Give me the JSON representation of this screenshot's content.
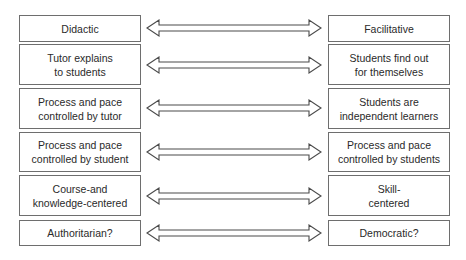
{
  "diagram": {
    "rows": [
      {
        "left": [
          "Didactic"
        ],
        "right": [
          "Facilitative"
        ]
      },
      {
        "left": [
          "Tutor explains",
          "to students"
        ],
        "right": [
          "Students find out",
          "for themselves"
        ]
      },
      {
        "left": [
          "Process and pace",
          "controlled by tutor"
        ],
        "right": [
          "Students are",
          "independent learners"
        ]
      },
      {
        "left": [
          "Process and pace",
          "controlled by student"
        ],
        "right": [
          "Process and pace",
          "controlled by students"
        ]
      },
      {
        "left": [
          "Course-and",
          "knowledge-centered"
        ],
        "right": [
          "Skill-",
          "centered"
        ]
      },
      {
        "left": [
          "Authoritarian?"
        ],
        "right": [
          "Democratic?"
        ]
      }
    ],
    "connector": "double-headed-arrow",
    "colors": {
      "border": "#6e6e6e",
      "text": "#2a2a2a",
      "background": "#ffffff"
    }
  }
}
